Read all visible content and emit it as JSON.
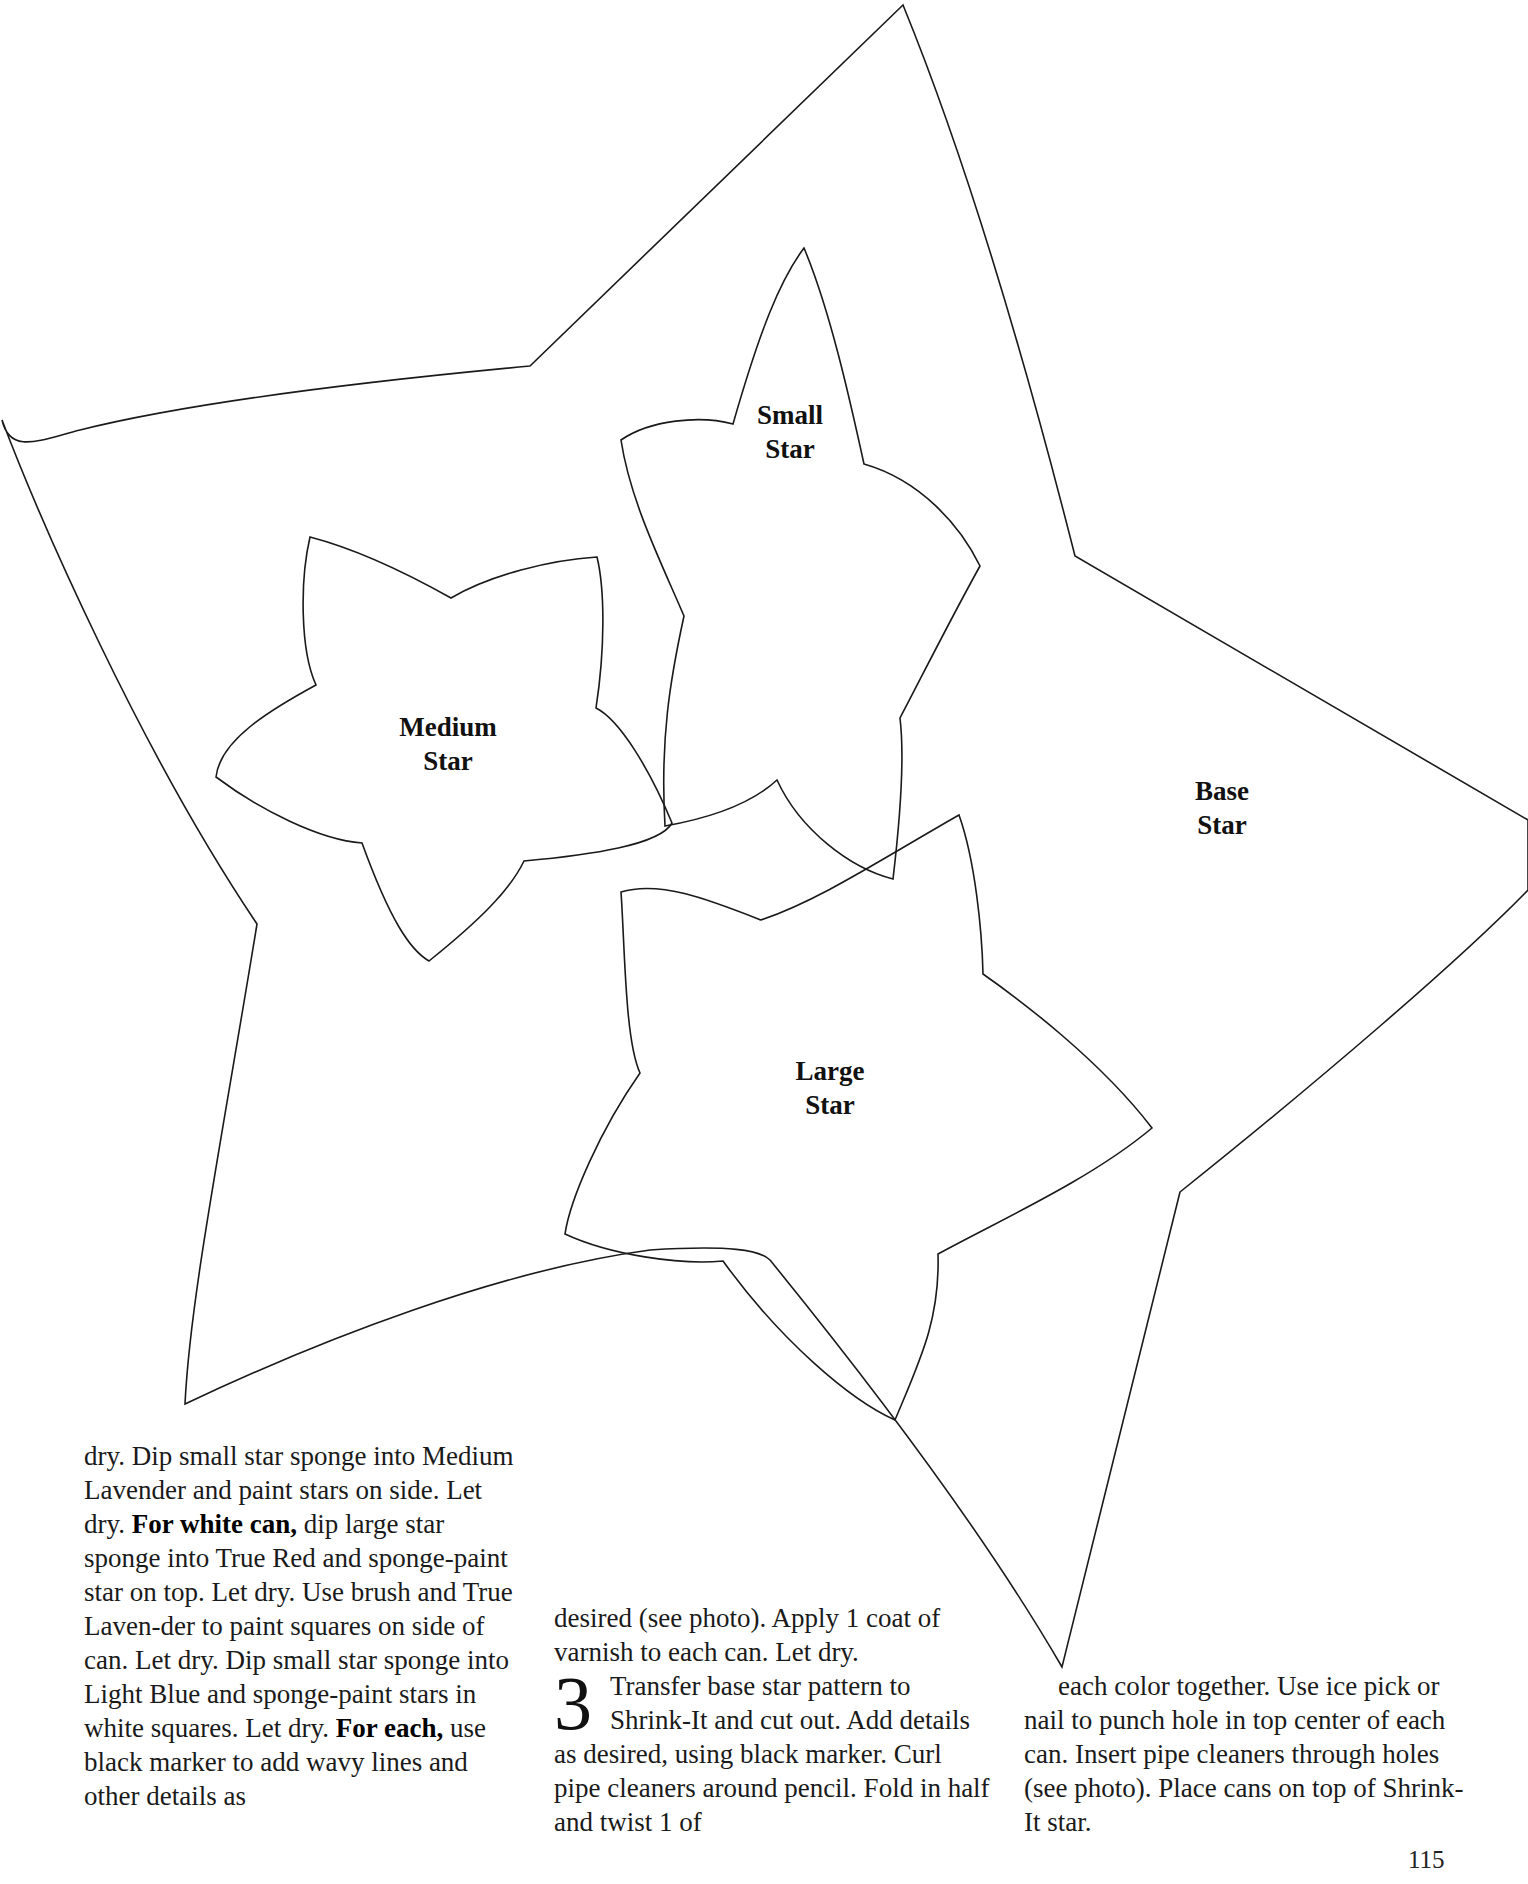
{
  "pattern": {
    "base_star_label": [
      "Base",
      "Star"
    ],
    "small_star_label": [
      "Small",
      "Star"
    ],
    "medium_star_label": [
      "Medium",
      "Star"
    ],
    "large_star_label": [
      "Large",
      "Star"
    ]
  },
  "column1": {
    "t1": "dry. Dip small star sponge into Medium Lavender and paint stars on side. Let dry. ",
    "b1": "For white can,",
    "t2": " dip large star sponge into True Red and sponge-paint star on top. Let dry. Use brush and True Laven-der to paint squares on side of can. Let dry. Dip small star sponge into Light Blue and sponge-paint stars in white squares. Let dry. ",
    "b2": "For each,",
    "t3": " use black marker to add wavy lines and other details as"
  },
  "column2": {
    "t1": "desired (see photo). Apply 1 coat of varnish to each can. Let dry.",
    "step_number": "3",
    "t2": "Transfer base star pattern to Shrink-It and cut out. Add details as desired, using black marker. Curl pipe cleaners around pencil. Fold in half and twist 1 of"
  },
  "column3": {
    "t1": "each color together. Use ice pick or nail to punch hole in top center of each can. Insert pipe cleaners through holes (see photo). Place cans on top of Shrink-It star."
  },
  "footer": {
    "page_number": "115"
  }
}
